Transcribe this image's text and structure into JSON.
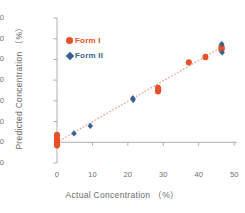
{
  "chart_data": {
    "type": "scatter",
    "title": "",
    "xlabel": "Actual Concentration （%）",
    "ylabel": "Predicted Concentration （%）",
    "xlim": [
      0,
      50.8
    ],
    "ylim": [
      -10,
      60
    ],
    "xticks": [
      0,
      10,
      20,
      30,
      40,
      50
    ],
    "yticks": [
      -10,
      0,
      10,
      20,
      30,
      40,
      50,
      60
    ],
    "grid": false,
    "legend_position": "upper-left-inside",
    "colors": {
      "form_i": "#E8502A",
      "form_ii": "#3A5F8F",
      "trendline": "#E9A595",
      "axis": "#A6A6A6",
      "tick_text": "#6e6e6e"
    },
    "trendline": {
      "style": "dotted",
      "x_start": 0.0,
      "y_start": 0.0,
      "x_end": 47.0,
      "y_end": 46.5
    },
    "series": [
      {
        "name": "Form I",
        "marker": "circle",
        "color": "#E8502A",
        "points": [
          [
            0.0,
            3.6
          ],
          [
            0.0,
            2.1
          ],
          [
            0.0,
            1.0
          ],
          [
            0.0,
            0.2
          ],
          [
            0.0,
            -0.6
          ],
          [
            0.0,
            -1.4
          ],
          [
            28.5,
            26.2
          ],
          [
            28.6,
            25.4
          ],
          [
            28.5,
            24.6
          ],
          [
            37.2,
            38.6
          ],
          [
            41.9,
            41.2
          ],
          [
            46.4,
            46.2
          ],
          [
            46.5,
            45.4
          ],
          [
            46.4,
            44.8
          ]
        ]
      },
      {
        "name": "Form II",
        "marker": "diamond",
        "color": "#3A5F8F",
        "points": [
          [
            4.8,
            4.3
          ],
          [
            9.4,
            7.9
          ],
          [
            21.4,
            21.3
          ],
          [
            21.5,
            20.5
          ],
          [
            46.5,
            47.4
          ],
          [
            46.6,
            43.4
          ]
        ]
      }
    ]
  },
  "legend": {
    "items": [
      {
        "label": "Form I",
        "marker": "circle",
        "color": "#E8502A"
      },
      {
        "label": "Form II",
        "marker": "diamond",
        "color": "#3A5F8F"
      }
    ]
  }
}
